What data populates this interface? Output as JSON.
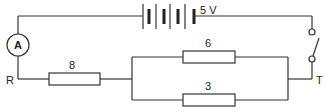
{
  "diagram": {
    "type": "circuit",
    "battery": {
      "label": "5 V",
      "cells": 3
    },
    "ammeter": {
      "label": "A"
    },
    "resistors": [
      {
        "id": "series",
        "label": "8"
      },
      {
        "id": "parallel-top",
        "label": "6"
      },
      {
        "id": "parallel-bottom",
        "label": "3"
      }
    ],
    "terminals": {
      "left": "R",
      "right": "T"
    },
    "switch": {
      "state": "open"
    }
  }
}
